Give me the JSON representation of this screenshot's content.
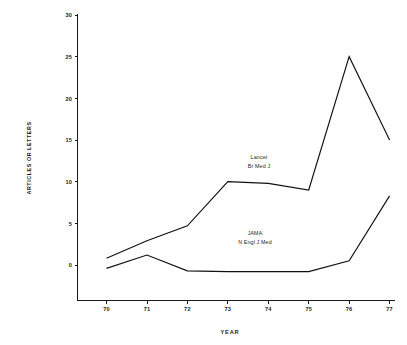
{
  "chart_data": {
    "type": "line",
    "title": "",
    "subtitle": "",
    "xlabel": "YEAR",
    "ylabel": "ARTICLES OR LETTERS",
    "x": [
      70,
      71,
      72,
      73,
      74,
      75,
      76,
      77
    ],
    "xtick_labels": [
      "70",
      "71",
      "72",
      "73",
      "74",
      "75",
      "76",
      "77"
    ],
    "ytick_labels": [
      "0",
      "5",
      "10",
      "15",
      "20",
      "25",
      "30"
    ],
    "yticks": [
      0,
      5,
      10,
      15,
      20,
      25,
      30
    ],
    "xlim": [
      69.4,
      77.4
    ],
    "ylim": [
      -3.5,
      30.6
    ],
    "grid": false,
    "legend_position": "inline-annotations",
    "series": [
      {
        "name": "Lancet / Br Med J",
        "label_lines": [
          "Lancet",
          "Br Med J"
        ],
        "values": [
          0.8,
          2.9,
          4.7,
          10.0,
          9.8,
          9.0,
          25.0,
          15.0
        ]
      },
      {
        "name": "JAMA / N Engl J Med",
        "label_lines": [
          "JAMA",
          "N Engl J Med"
        ],
        "values": [
          -0.4,
          1.2,
          -0.7,
          -0.8,
          -0.8,
          -0.8,
          0.5,
          8.3
        ]
      }
    ],
    "annotations": [
      {
        "id": "lancet",
        "line1": "Lancet",
        "line2": "Br Med J",
        "x": 73.6,
        "y": 13.4
      },
      {
        "id": "jama",
        "line1": "JAMA",
        "line2": "N Engl J Med",
        "x": 73.4,
        "y": 4.3
      }
    ]
  }
}
